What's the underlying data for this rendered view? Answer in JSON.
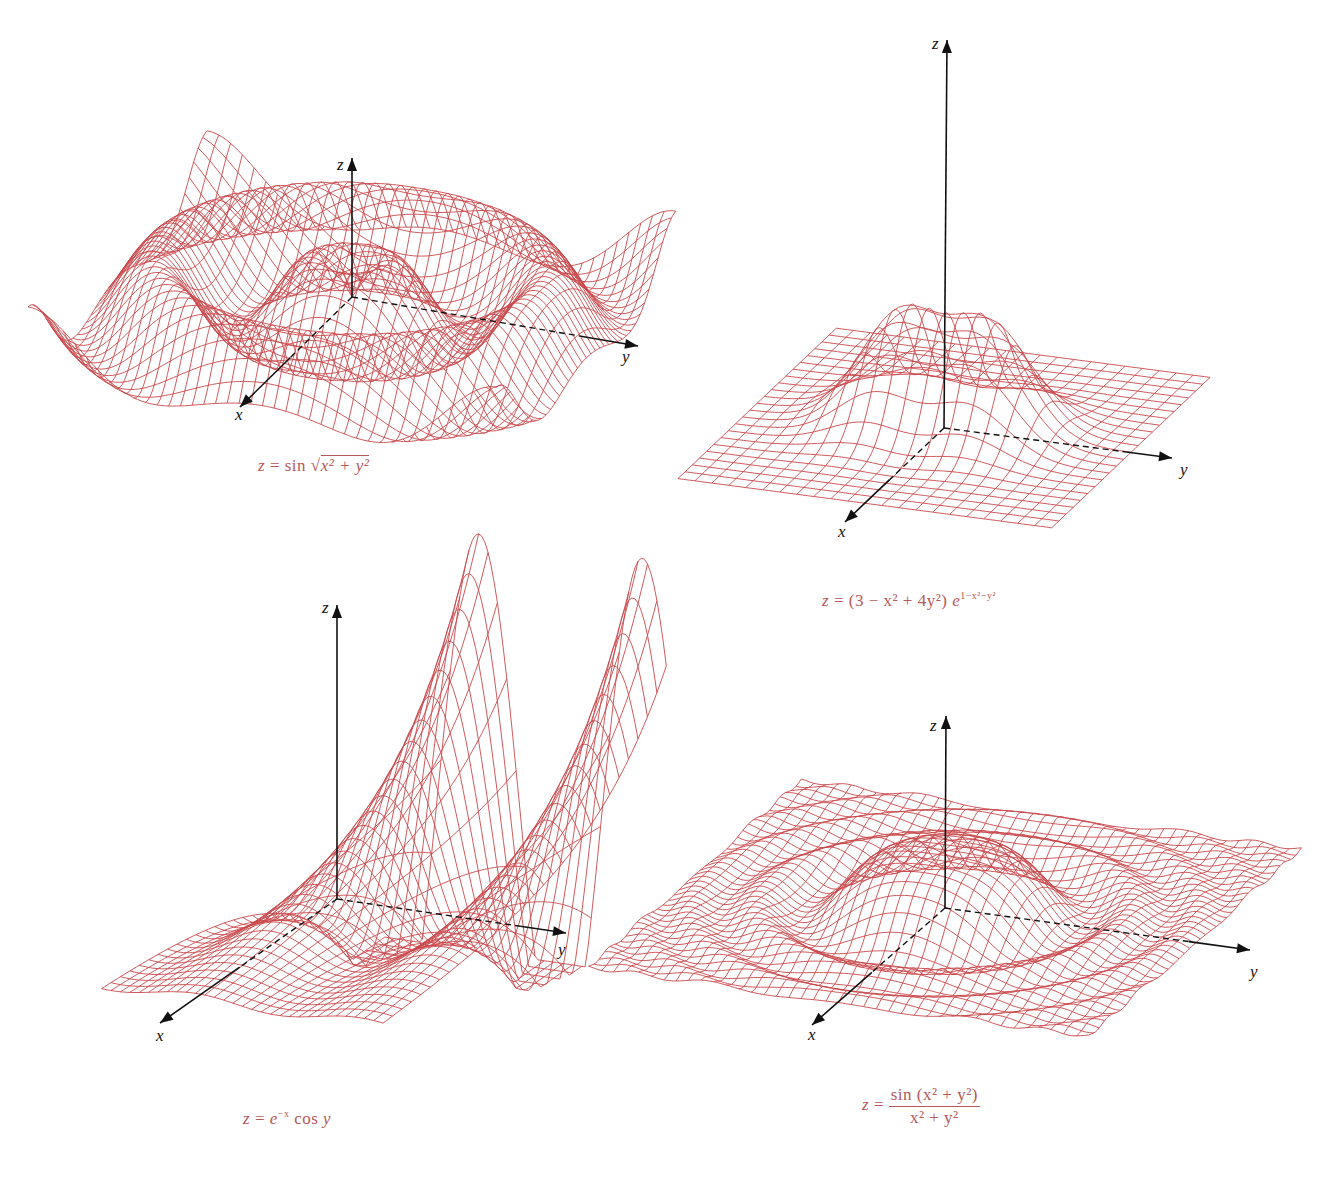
{
  "figure": {
    "background": "#ffffff",
    "surface_color": "#c8474b",
    "axis_color": "#111111",
    "caption_color": "#b5585a"
  },
  "chart_data": [
    {
      "type": "surface-wireframe",
      "id": "sin-sqrt",
      "title": "z = sin √(x² + y²)",
      "caption_parts": {
        "lhs": "z",
        "eq": "=",
        "fn": "sin",
        "radicand": "x² + y²"
      },
      "function": "sin(sqrt(x^2+y^2))",
      "axes": {
        "x": "x",
        "y": "y",
        "z": "z"
      },
      "grid": 40,
      "domain": [
        -10,
        10
      ],
      "region": {
        "left": 40,
        "top": 150,
        "width": 660,
        "height": 290
      },
      "origin": [
        352,
        297
      ],
      "x_axis_end": [
        240,
        407
      ],
      "y_axis_end": [
        638,
        346
      ],
      "z_axis_end": [
        352,
        158
      ]
    },
    {
      "type": "surface-wireframe",
      "id": "gaussian-bump",
      "title": "z = (3 − x² + 4y²) e^(1−x²−y²)",
      "caption_parts": {
        "lhs": "z",
        "eq": "=",
        "body": "(3 − x² + 4y²)",
        "base": "e",
        "exp": "1−x²−y²"
      },
      "function": "(3-x^2+4y^2)*exp(1-x^2-y^2)",
      "axes": {
        "x": "x",
        "y": "y",
        "z": "z"
      },
      "grid": 22,
      "domain": [
        -3,
        3
      ],
      "region": {
        "left": 700,
        "top": 30,
        "width": 520,
        "height": 520
      },
      "origin": [
        944,
        428
      ],
      "x_axis_end": [
        845,
        522
      ],
      "y_axis_end": [
        1172,
        458
      ],
      "z_axis_end": [
        947,
        40
      ]
    },
    {
      "type": "surface-wireframe",
      "id": "exp-cos",
      "title": "z = e^(−x) cos y",
      "caption_parts": {
        "lhs": "z",
        "eq": "=",
        "base": "e",
        "exp": "−x",
        "fn": "cos",
        "var": "y"
      },
      "function": "exp(-x)*cos(y)",
      "axes": {
        "x": "x",
        "y": "y",
        "z": "z"
      },
      "grid": 30,
      "domain_x": [
        -2,
        2
      ],
      "domain_y": [
        -3.6,
        7.2
      ],
      "region": {
        "left": 30,
        "top": 600,
        "width": 560,
        "height": 480
      },
      "origin": [
        337,
        899
      ],
      "x_axis_end": [
        160,
        1023
      ],
      "y_axis_end": [
        566,
        933
      ],
      "z_axis_end": [
        337,
        605
      ]
    },
    {
      "type": "surface-wireframe",
      "id": "sinc-radial",
      "title": "z = sin(x² + y²) / (x² + y²)",
      "caption_parts": {
        "lhs": "z",
        "eq": "=",
        "numerator": "sin (x² + y²)",
        "denominator": "x² + y²"
      },
      "function": "sin(x^2+y^2)/(x^2+y^2)",
      "axes": {
        "x": "x",
        "y": "y",
        "z": "z"
      },
      "grid": 40,
      "domain": [
        -4,
        4
      ],
      "region": {
        "left": 590,
        "top": 650,
        "width": 720,
        "height": 390
      },
      "origin": [
        945,
        908
      ],
      "x_axis_end": [
        812,
        1025
      ],
      "y_axis_end": [
        1250,
        950
      ],
      "z_axis_end": [
        946,
        716
      ]
    }
  ]
}
